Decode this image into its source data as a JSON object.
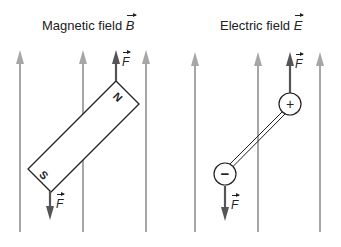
{
  "panels": [
    {
      "id": "magnetic",
      "title": "Magnetic field",
      "field_symbol": "B",
      "force_symbol": "F",
      "object": "bar magnet",
      "poles": {
        "north": "N",
        "south": "S"
      }
    },
    {
      "id": "electric",
      "title": "Electric field",
      "field_symbol": "E",
      "force_symbol": "F",
      "object": "electric dipole",
      "charges": {
        "positive": "+",
        "negative": "−"
      }
    }
  ],
  "colors": {
    "field_lines": "#a6a6a6",
    "force_arrows": "#555555",
    "outline": "#222222",
    "background": "#ffffff"
  }
}
